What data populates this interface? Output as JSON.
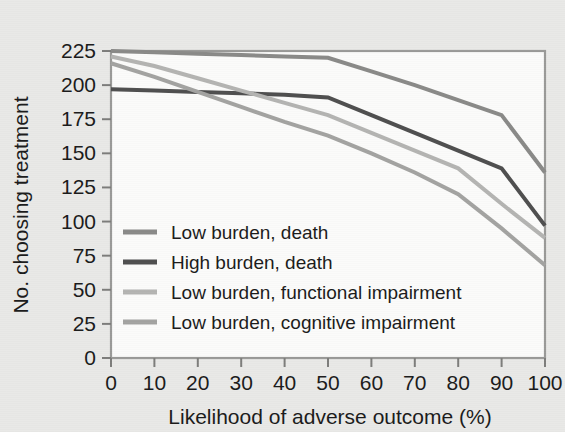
{
  "chart_data": {
    "type": "line",
    "title": "",
    "subtitle": "",
    "xlabel": "Likelihood of adverse outcome (%)",
    "ylabel": "No. choosing treatment",
    "xlim": [
      0,
      100
    ],
    "ylim": [
      0,
      225
    ],
    "xticks": [
      0,
      10,
      20,
      30,
      40,
      50,
      60,
      70,
      80,
      90,
      100
    ],
    "yticks": [
      0,
      25,
      50,
      75,
      100,
      125,
      150,
      175,
      200,
      225
    ],
    "xtick_labels": [
      "0",
      "10",
      "20",
      "30",
      "40",
      "50",
      "60",
      "70",
      "80",
      "90",
      "100"
    ],
    "ytick_labels": [
      "0",
      "25",
      "50",
      "75",
      "100",
      "125",
      "150",
      "175",
      "200",
      "225"
    ],
    "grid": false,
    "legend_position": "center-left inside plot",
    "x": [
      0,
      10,
      20,
      30,
      40,
      50,
      60,
      70,
      80,
      90,
      100
    ],
    "series": [
      {
        "name": "Low burden, death",
        "color": "#8a8a88",
        "linewidth": 4,
        "values": [
          225,
          224,
          223,
          222,
          221,
          220,
          210,
          200,
          189,
          178,
          136
        ]
      },
      {
        "name": "High burden, death",
        "color": "#4f4f4f",
        "linewidth": 4,
        "values": [
          197,
          196,
          195,
          194,
          193,
          191,
          178,
          165,
          152,
          139,
          97
        ]
      },
      {
        "name": "Low burden, functional impairment",
        "color": "#b4b4b2",
        "linewidth": 4,
        "values": [
          221,
          214,
          205,
          196,
          187,
          178,
          165,
          152,
          139,
          113,
          88
        ]
      },
      {
        "name": "Low burden, cognitive impairment",
        "color": "#a3a3a1",
        "linewidth": 4,
        "values": [
          216,
          206,
          195,
          184,
          173,
          163,
          150,
          136,
          120,
          95,
          68
        ]
      }
    ]
  },
  "axes": {
    "y_title": "No. choosing treatment",
    "x_title": "Likelihood of adverse outcome (%)"
  },
  "legend": {
    "items": [
      {
        "label": "Low burden, death",
        "swatch_color": "#8a8a88"
      },
      {
        "label": "High burden, death",
        "swatch_color": "#4f4f4f"
      },
      {
        "label": "Low burden, functional impairment",
        "swatch_color": "#b4b4b2"
      },
      {
        "label": "Low burden, cognitive impairment",
        "swatch_color": "#a3a3a1"
      }
    ]
  },
  "colors": {
    "background": "#e9e9e7",
    "plot_background": "#fbfbfa",
    "frame": "#9a9a98",
    "text": "#1b1b1b"
  }
}
